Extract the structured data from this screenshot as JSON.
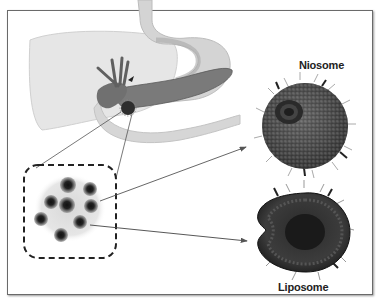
{
  "figure": {
    "labels": {
      "niosome": "Niosome",
      "liposome": "Liposome"
    },
    "elements": [
      "liver-illustration",
      "stomach-illustration",
      "pancreas-illustration",
      "gallbladder-illustration",
      "tumor-site",
      "nanoparticle-cluster-inset",
      "niosome-vesicle",
      "liposome-vesicle"
    ],
    "colors": {
      "frame": "#6a6a6a",
      "organ_light": "#e4e4e4",
      "organ_mid": "#bdbdbd",
      "organ_dark": "#6e6e6e",
      "vesicle": "#3a3a3a"
    }
  }
}
